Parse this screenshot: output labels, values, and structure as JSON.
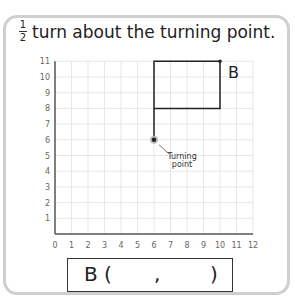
{
  "instruction": {
    "fraction_numerator": "1",
    "fraction_denominator": "2",
    "text": "turn about the turning point."
  },
  "chart_data": {
    "type": "diagram",
    "x_ticks": [
      "0",
      "1",
      "2",
      "3",
      "4",
      "5",
      "6",
      "7",
      "8",
      "9",
      "10",
      "11",
      "12"
    ],
    "y_ticks": [
      "1",
      "2",
      "3",
      "4",
      "5",
      "6",
      "7",
      "8",
      "9",
      "10",
      "11"
    ],
    "xlim": [
      0,
      12
    ],
    "ylim": [
      0,
      11
    ],
    "grid": true,
    "shape_path": [
      [
        6,
        6
      ],
      [
        6,
        11
      ],
      [
        10,
        11
      ],
      [
        10,
        8
      ],
      [
        6,
        8
      ]
    ],
    "point_B": {
      "label": "B",
      "x": 10,
      "y": 11
    },
    "turning_point": {
      "x": 6,
      "y": 6,
      "label": "Turning point"
    }
  },
  "labels": {
    "point_b": "B",
    "turning_point_line1": "Turning",
    "turning_point_line2": "point"
  },
  "answer": {
    "prefix": "B (",
    "comma": ",",
    "suffix": ")"
  }
}
